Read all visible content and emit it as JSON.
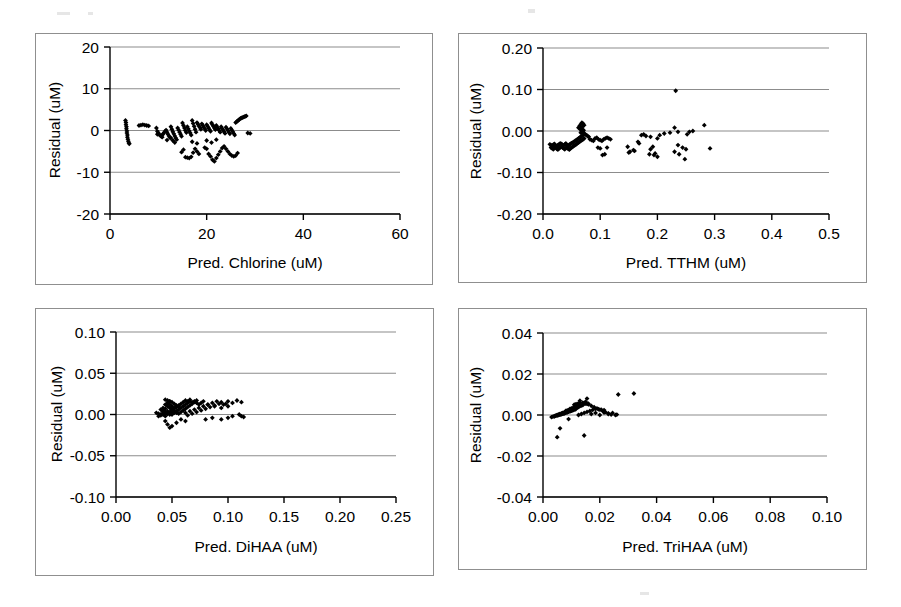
{
  "figure": {
    "background_color": "#ffffff",
    "panel_border_color": "#8f8f8f",
    "axis_color": "#000000",
    "gridline_color": "#8c8c8c",
    "marker_color": "#000000",
    "panel_count": 4,
    "layout": "2x2 grid of residual scatter plots"
  },
  "chart_data": [
    {
      "id": "panel-chlorine",
      "type": "scatter",
      "title": "",
      "xlabel": "Pred. Chlorine (uM)",
      "ylabel": "Residual (uM)",
      "xlim": [
        0,
        60
      ],
      "ylim": [
        -20,
        20
      ],
      "xticks": [
        0,
        20,
        40,
        60
      ],
      "xticklabels": [
        "0",
        "20",
        "40",
        "60"
      ],
      "yticks": [
        -20,
        -10,
        0,
        10,
        20
      ],
      "yticklabels": [
        "-20",
        "-10",
        "0",
        "10",
        "20"
      ],
      "grid": "horizontal",
      "legend": "none",
      "x": [
        3.2,
        3.3,
        3.3,
        3.4,
        3.4,
        3.5,
        3.5,
        3.6,
        3.6,
        3.7,
        3.8,
        3.9,
        4.0,
        6.0,
        6.4,
        6.8,
        7.2,
        7.6,
        8.0,
        9.6,
        9.8,
        10.0,
        10.2,
        10.4,
        10.6,
        10.8,
        11.0,
        11.2,
        11.4,
        11.6,
        11.8,
        12.0,
        12.2,
        12.4,
        12.6,
        12.8,
        13.0,
        13.2,
        13.4,
        13.6,
        13.8,
        14.0,
        14.2,
        14.4,
        14.6,
        14.8,
        15.0,
        15.2,
        15.4,
        15.6,
        15.8,
        16.0,
        16.2,
        16.4,
        16.6,
        16.8,
        17.0,
        17.2,
        17.4,
        17.6,
        17.8,
        18.0,
        18.2,
        18.4,
        18.6,
        18.8,
        19.0,
        19.2,
        19.4,
        19.6,
        19.8,
        20.0,
        20.2,
        20.4,
        20.6,
        20.8,
        21.0,
        21.2,
        21.4,
        21.6,
        21.8,
        22.0,
        22.2,
        22.4,
        22.6,
        22.8,
        23.0,
        23.2,
        23.4,
        23.6,
        23.8,
        24.0,
        24.2,
        24.4,
        24.6,
        24.8,
        25.0,
        25.2,
        25.4,
        25.6,
        25.8,
        26.0,
        26.2,
        26.4,
        26.6,
        26.8,
        27.0,
        27.2,
        27.4,
        27.6,
        27.8,
        28.0,
        28.2,
        28.5,
        29.0,
        14.8,
        15.2,
        15.6,
        16.0,
        16.4,
        16.8,
        17.2,
        17.6,
        18.0,
        18.4,
        19.6,
        20.0,
        20.4,
        20.8,
        21.2,
        21.6,
        22.0,
        22.4,
        22.8,
        23.2,
        23.6,
        24.0,
        24.4,
        24.8,
        25.2,
        25.6,
        26.0,
        26.4,
        12.6,
        13.0,
        13.4,
        11.8,
        10.8,
        9.8,
        20.0,
        21.0,
        22.0,
        17.0,
        18.0
      ],
      "y": [
        2.4,
        1.9,
        1.4,
        0.9,
        0.4,
        -0.1,
        -0.6,
        -1.1,
        -1.6,
        -2.1,
        -2.6,
        -3.0,
        -3.2,
        1.2,
        1.3,
        1.4,
        1.3,
        1.2,
        1.1,
        0.6,
        -0.2,
        -0.6,
        -1.0,
        -1.2,
        -1.4,
        -1.1,
        -0.8,
        -0.5,
        -0.2,
        0.1,
        -0.4,
        -0.9,
        -1.3,
        -1.7,
        0.9,
        0.3,
        -0.3,
        -0.8,
        -1.3,
        -1.8,
        -2.2,
        0.6,
        0.1,
        -0.4,
        -0.9,
        -1.4,
        1.8,
        1.2,
        0.6,
        0.0,
        -0.5,
        0.9,
        0.4,
        -0.1,
        -0.6,
        -1.1,
        2.4,
        1.7,
        1.0,
        0.3,
        -0.4,
        1.9,
        1.5,
        1.1,
        0.7,
        0.3,
        1.6,
        1.2,
        0.8,
        0.4,
        0.0,
        1.4,
        1.0,
        0.6,
        0.2,
        -0.2,
        1.8,
        1.4,
        1.0,
        0.6,
        0.2,
        1.2,
        0.8,
        0.4,
        0.0,
        -0.4,
        0.9,
        0.5,
        0.1,
        -0.3,
        -0.7,
        0.8,
        0.4,
        0.0,
        -0.4,
        -0.8,
        0.5,
        0.1,
        -0.3,
        -0.7,
        -1.1,
        1.9,
        2.1,
        2.3,
        2.5,
        2.7,
        2.9,
        3.0,
        3.1,
        3.2,
        3.3,
        3.4,
        3.5,
        -0.6,
        -0.7,
        -5.2,
        -4.6,
        -6.4,
        -6.5,
        -6.6,
        -6.3,
        -5.3,
        -4.4,
        -5.0,
        -5.6,
        -4.1,
        -4.4,
        -5.6,
        -6.2,
        -7.0,
        -7.4,
        -6.6,
        -5.8,
        -5.0,
        -4.2,
        -3.8,
        -4.4,
        -5.0,
        -5.6,
        -6.0,
        -6.2,
        -6.0,
        -5.4,
        -1.8,
        -2.4,
        -2.9,
        -2.3,
        -1.6,
        -0.9,
        -2.4,
        -2.9,
        -2.2,
        -2.7,
        -3.1
      ]
    },
    {
      "id": "panel-tthm",
      "type": "scatter",
      "title": "",
      "xlabel": "Pred. TTHM (uM)",
      "ylabel": "Residual (uM)",
      "xlim": [
        0.0,
        0.5
      ],
      "ylim": [
        -0.2,
        0.2
      ],
      "xticks": [
        0.0,
        0.1,
        0.2,
        0.3,
        0.4,
        0.5
      ],
      "xticklabels": [
        "0.0",
        "0.1",
        "0.2",
        "0.3",
        "0.4",
        "0.5"
      ],
      "yticks": [
        -0.2,
        -0.1,
        0.0,
        0.1,
        0.2
      ],
      "yticklabels": [
        "-0.20",
        "-0.10",
        "0.00",
        "0.10",
        "0.20"
      ],
      "grid": "horizontal",
      "legend": "none",
      "x": [
        0.012,
        0.014,
        0.016,
        0.018,
        0.02,
        0.022,
        0.024,
        0.026,
        0.028,
        0.03,
        0.014,
        0.016,
        0.018,
        0.02,
        0.022,
        0.024,
        0.026,
        0.028,
        0.03,
        0.032,
        0.032,
        0.034,
        0.036,
        0.038,
        0.04,
        0.042,
        0.044,
        0.046,
        0.048,
        0.05,
        0.034,
        0.036,
        0.038,
        0.04,
        0.042,
        0.044,
        0.046,
        0.048,
        0.05,
        0.052,
        0.052,
        0.054,
        0.056,
        0.058,
        0.06,
        0.062,
        0.064,
        0.066,
        0.068,
        0.07,
        0.054,
        0.056,
        0.058,
        0.06,
        0.062,
        0.064,
        0.066,
        0.068,
        0.07,
        0.072,
        0.062,
        0.064,
        0.066,
        0.068,
        0.07,
        0.072,
        0.065,
        0.067,
        0.069,
        0.071,
        0.066,
        0.068,
        0.07,
        0.072,
        0.074,
        0.076,
        0.078,
        0.08,
        0.082,
        0.085,
        0.088,
        0.091,
        0.094,
        0.097,
        0.1,
        0.103,
        0.106,
        0.109,
        0.112,
        0.115,
        0.118,
        0.104,
        0.108,
        0.096,
        0.1,
        0.112,
        0.148,
        0.152,
        0.16,
        0.168,
        0.172,
        0.176,
        0.18,
        0.188,
        0.192,
        0.196,
        0.15,
        0.158,
        0.166,
        0.186,
        0.194,
        0.2,
        0.204,
        0.212,
        0.222,
        0.23,
        0.236,
        0.244,
        0.25,
        0.256,
        0.262,
        0.232,
        0.248,
        0.282,
        0.292,
        0.23,
        0.238,
        0.188,
        0.2,
        0.252,
        0.236
      ],
      "y": [
        -0.032,
        -0.034,
        -0.036,
        -0.033,
        -0.031,
        -0.035,
        -0.037,
        -0.034,
        -0.032,
        -0.03,
        -0.04,
        -0.042,
        -0.044,
        -0.041,
        -0.039,
        -0.043,
        -0.045,
        -0.042,
        -0.04,
        -0.038,
        -0.031,
        -0.033,
        -0.035,
        -0.032,
        -0.03,
        -0.034,
        -0.036,
        -0.033,
        -0.031,
        -0.029,
        -0.04,
        -0.042,
        -0.044,
        -0.041,
        -0.039,
        -0.043,
        -0.045,
        -0.042,
        -0.04,
        -0.038,
        -0.028,
        -0.026,
        -0.024,
        -0.022,
        -0.02,
        -0.018,
        -0.016,
        -0.014,
        -0.012,
        -0.01,
        -0.036,
        -0.034,
        -0.032,
        -0.03,
        -0.028,
        -0.026,
        -0.024,
        -0.022,
        -0.02,
        -0.018,
        0.008,
        0.012,
        0.016,
        0.02,
        0.018,
        0.014,
        0.004,
        0.006,
        0.01,
        0.002,
        -0.004,
        -0.002,
        0.0,
        -0.006,
        -0.008,
        -0.01,
        -0.012,
        -0.014,
        -0.02,
        -0.022,
        -0.024,
        -0.018,
        -0.016,
        -0.02,
        -0.022,
        -0.024,
        -0.02,
        -0.018,
        -0.016,
        -0.018,
        -0.02,
        -0.058,
        -0.056,
        -0.04,
        -0.042,
        -0.04,
        -0.038,
        -0.05,
        -0.048,
        -0.03,
        -0.01,
        -0.008,
        -0.012,
        -0.044,
        -0.038,
        -0.054,
        -0.052,
        -0.046,
        -0.026,
        -0.056,
        -0.058,
        -0.062,
        -0.01,
        -0.006,
        -0.004,
        0.008,
        -0.034,
        -0.04,
        -0.044,
        -0.002,
        0.0,
        0.097,
        -0.068,
        0.014,
        -0.042,
        -0.05,
        -0.056,
        -0.014,
        -0.018,
        -0.008,
        -0.002
      ]
    },
    {
      "id": "panel-dihaa",
      "type": "scatter",
      "title": "",
      "xlabel": "Pred. DiHAA (uM)",
      "ylabel": "Residual (uM)",
      "xlim": [
        0.0,
        0.25
      ],
      "ylim": [
        -0.1,
        0.1
      ],
      "xticks": [
        0.0,
        0.05,
        0.1,
        0.15,
        0.2,
        0.25
      ],
      "xticklabels": [
        "0.00",
        "0.05",
        "0.10",
        "0.15",
        "0.20",
        "0.25"
      ],
      "yticks": [
        -0.1,
        -0.05,
        0.0,
        0.05,
        0.1
      ],
      "yticklabels": [
        "-0.10",
        "-0.05",
        "0.00",
        "0.05",
        "0.10"
      ],
      "grid": "horizontal",
      "legend": "none",
      "x": [
        0.036,
        0.038,
        0.04,
        0.042,
        0.044,
        0.046,
        0.038,
        0.04,
        0.042,
        0.044,
        0.04,
        0.042,
        0.044,
        0.046,
        0.048,
        0.05,
        0.042,
        0.044,
        0.046,
        0.048,
        0.044,
        0.046,
        0.048,
        0.05,
        0.052,
        0.054,
        0.046,
        0.048,
        0.05,
        0.052,
        0.048,
        0.05,
        0.052,
        0.054,
        0.056,
        0.044,
        0.046,
        0.048,
        0.042,
        0.044,
        0.046,
        0.048,
        0.05,
        0.052,
        0.054,
        0.056,
        0.058,
        0.06,
        0.062,
        0.064,
        0.05,
        0.052,
        0.054,
        0.056,
        0.058,
        0.06,
        0.062,
        0.064,
        0.066,
        0.068,
        0.056,
        0.058,
        0.06,
        0.062,
        0.064,
        0.066,
        0.068,
        0.07,
        0.072,
        0.074,
        0.062,
        0.066,
        0.07,
        0.074,
        0.078,
        0.082,
        0.086,
        0.09,
        0.094,
        0.098,
        0.064,
        0.068,
        0.072,
        0.076,
        0.08,
        0.084,
        0.088,
        0.092,
        0.096,
        0.1,
        0.07,
        0.076,
        0.082,
        0.088,
        0.094,
        0.1,
        0.104,
        0.108,
        0.112,
        0.114,
        0.046,
        0.05,
        0.054,
        0.044,
        0.048,
        0.058,
        0.062,
        0.08,
        0.086,
        0.094,
        0.1,
        0.104,
        0.11,
        0.112,
        0.066,
        0.072,
        0.078
      ],
      "y": [
        0.002,
        0.001,
        0.0,
        0.003,
        0.002,
        0.001,
        -0.002,
        -0.001,
        0.004,
        0.003,
        0.006,
        0.005,
        0.002,
        0.001,
        0.0,
        0.003,
        0.008,
        0.007,
        0.004,
        0.002,
        0.012,
        0.01,
        0.008,
        0.006,
        0.004,
        0.002,
        0.014,
        0.012,
        0.01,
        0.008,
        0.016,
        0.015,
        0.013,
        0.011,
        0.009,
        0.018,
        0.017,
        0.016,
        0.0,
        -0.002,
        0.001,
        0.003,
        0.005,
        0.007,
        0.009,
        0.011,
        0.013,
        0.015,
        0.017,
        0.016,
        0.0,
        0.002,
        0.004,
        0.006,
        0.008,
        0.01,
        0.012,
        0.014,
        0.016,
        0.015,
        0.001,
        0.003,
        0.005,
        0.007,
        0.009,
        0.011,
        0.013,
        0.015,
        0.014,
        0.012,
        0.002,
        0.004,
        0.006,
        0.008,
        0.01,
        0.012,
        0.014,
        0.016,
        0.015,
        0.013,
        -0.001,
        0.001,
        0.003,
        0.005,
        0.007,
        0.009,
        0.011,
        0.013,
        0.012,
        0.01,
        0.016,
        0.014,
        0.012,
        0.01,
        0.008,
        0.016,
        0.014,
        0.017,
        0.015,
        -0.003,
        -0.012,
        -0.014,
        -0.01,
        -0.008,
        -0.016,
        -0.006,
        -0.008,
        -0.006,
        -0.004,
        -0.006,
        -0.004,
        -0.002,
        0.0,
        -0.002,
        0.018,
        0.017,
        0.016
      ]
    },
    {
      "id": "panel-trihaa",
      "type": "scatter",
      "title": "",
      "xlabel": "Pred. TriHAA (uM)",
      "ylabel": "Residual (uM)",
      "xlim": [
        0.0,
        0.1
      ],
      "ylim": [
        -0.04,
        0.04
      ],
      "xticks": [
        0.0,
        0.02,
        0.04,
        0.06,
        0.08,
        0.1
      ],
      "xticklabels": [
        "0.00",
        "0.02",
        "0.04",
        "0.06",
        "0.08",
        "0.10"
      ],
      "yticks": [
        -0.04,
        -0.02,
        0.0,
        0.02,
        0.04
      ],
      "yticklabels": [
        "-0.04",
        "-0.02",
        "0.00",
        "0.02",
        "0.04"
      ],
      "grid": "horizontal",
      "legend": "none",
      "x": [
        0.003,
        0.0035,
        0.004,
        0.0045,
        0.005,
        0.0055,
        0.006,
        0.0065,
        0.007,
        0.0075,
        0.004,
        0.0045,
        0.005,
        0.0055,
        0.006,
        0.0065,
        0.007,
        0.0075,
        0.008,
        0.0085,
        0.005,
        0.0055,
        0.006,
        0.0065,
        0.007,
        0.0075,
        0.008,
        0.0085,
        0.009,
        0.0095,
        0.006,
        0.0065,
        0.007,
        0.0075,
        0.008,
        0.0085,
        0.009,
        0.0095,
        0.01,
        0.0105,
        0.007,
        0.0075,
        0.008,
        0.0085,
        0.009,
        0.0095,
        0.01,
        0.0105,
        0.011,
        0.0115,
        0.008,
        0.0085,
        0.009,
        0.0095,
        0.01,
        0.0105,
        0.011,
        0.0115,
        0.012,
        0.0125,
        0.0095,
        0.01,
        0.0105,
        0.011,
        0.0115,
        0.012,
        0.0125,
        0.013,
        0.0135,
        0.014,
        0.011,
        0.0115,
        0.012,
        0.0125,
        0.013,
        0.014,
        0.0145,
        0.015,
        0.0155,
        0.016,
        0.0125,
        0.0135,
        0.0145,
        0.0155,
        0.0165,
        0.0175,
        0.0185,
        0.0195,
        0.0205,
        0.0215,
        0.015,
        0.016,
        0.017,
        0.018,
        0.019,
        0.02,
        0.021,
        0.022,
        0.023,
        0.024,
        0.017,
        0.0185,
        0.02,
        0.0215,
        0.023,
        0.0245,
        0.0255,
        0.026,
        0.0265,
        0.032,
        0.013,
        0.0155,
        0.005,
        0.006,
        0.0145,
        0.009
      ],
      "y": [
        -0.001,
        -0.0008,
        -0.0006,
        -0.0004,
        -0.0002,
        0.0,
        0.0002,
        0.0004,
        0.0006,
        0.0008,
        -0.0005,
        -0.0003,
        -0.0001,
        0.0001,
        0.0003,
        0.0005,
        0.0007,
        0.0009,
        0.0011,
        0.0013,
        0.0,
        0.0002,
        0.0004,
        0.0006,
        0.0008,
        0.001,
        0.0012,
        0.0014,
        0.0016,
        0.0018,
        0.0005,
        0.0007,
        0.0009,
        0.0011,
        0.0013,
        0.0015,
        0.0017,
        0.0019,
        0.0021,
        0.0023,
        0.001,
        0.0012,
        0.0014,
        0.0016,
        0.0018,
        0.002,
        0.0022,
        0.0024,
        0.0026,
        0.0028,
        0.002,
        0.0022,
        0.0024,
        0.0026,
        0.0028,
        0.003,
        0.0032,
        0.0034,
        0.0036,
        0.0038,
        0.003,
        0.0032,
        0.0034,
        0.0036,
        0.0038,
        0.004,
        0.0042,
        0.0044,
        0.0046,
        0.0048,
        0.005,
        0.0052,
        0.0054,
        0.0056,
        0.0058,
        0.006,
        0.0058,
        0.0056,
        0.0054,
        0.0052,
        0.0,
        0.0005,
        0.001,
        0.0015,
        0.002,
        0.0025,
        0.003,
        0.0028,
        0.0026,
        0.0024,
        0.0065,
        0.0055,
        0.0045,
        0.0038,
        0.0032,
        0.0026,
        0.002,
        0.0014,
        0.0008,
        0.0002,
        0.0005,
        0.001,
        0.0,
        0.0012,
        0.0005,
        0.001,
        0.0,
        0.0002,
        0.01,
        0.0105,
        0.007,
        0.008,
        -0.0108,
        -0.0065,
        -0.01,
        -0.002
      ]
    }
  ]
}
